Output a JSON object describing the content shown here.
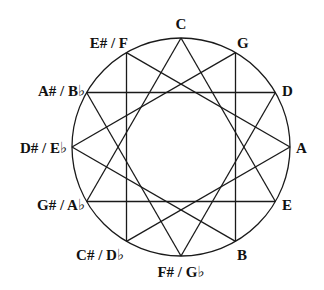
{
  "diagram": {
    "type": "circle-of-fifths-augmented-triads",
    "circle": {
      "cx": 181,
      "cy": 147,
      "r": 109,
      "stroke": "#1a1a1a"
    },
    "line_color": "#1a1a1a",
    "notes": [
      {
        "index": 0,
        "label": "C",
        "anchor": "middle",
        "lx": 181,
        "ly": 29
      },
      {
        "index": 1,
        "label": "G",
        "anchor": "start",
        "lx": 237,
        "ly": 48
      },
      {
        "index": 2,
        "label": "D",
        "anchor": "start",
        "lx": 282,
        "ly": 96
      },
      {
        "index": 3,
        "label": "A",
        "anchor": "start",
        "lx": 296,
        "ly": 153
      },
      {
        "index": 4,
        "label": "E",
        "anchor": "start",
        "lx": 282,
        "ly": 210
      },
      {
        "index": 5,
        "label": "B",
        "anchor": "start",
        "lx": 237,
        "ly": 260
      },
      {
        "index": 6,
        "label": "F# / G♭",
        "anchor": "middle",
        "lx": 181,
        "ly": 277
      },
      {
        "index": 7,
        "label": "C# / D♭",
        "anchor": "end",
        "lx": 124,
        "ly": 260
      },
      {
        "index": 8,
        "label": "G# / A♭",
        "anchor": "end",
        "lx": 85,
        "ly": 210
      },
      {
        "index": 9,
        "label": "D# / E♭",
        "anchor": "end",
        "lx": 67,
        "ly": 153
      },
      {
        "index": 10,
        "label": "A# / B♭",
        "anchor": "end",
        "lx": 85,
        "ly": 96
      },
      {
        "index": 11,
        "label": "E# / F",
        "anchor": "end",
        "lx": 128,
        "ly": 48
      }
    ],
    "triads": [
      {
        "name": "C-E-G#",
        "vertices": [
          0,
          4,
          8
        ]
      },
      {
        "name": "G-B-D#",
        "vertices": [
          1,
          5,
          9
        ]
      },
      {
        "name": "D-F#-A#",
        "vertices": [
          2,
          6,
          10
        ]
      },
      {
        "name": "A-C#-E#",
        "vertices": [
          3,
          7,
          11
        ]
      }
    ]
  }
}
